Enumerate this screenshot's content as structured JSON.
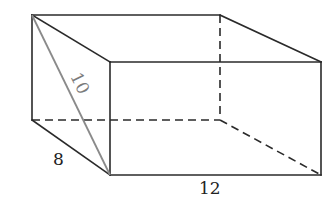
{
  "figure": {
    "type": "rectangular-prism",
    "labels": {
      "diagonal": "10",
      "depth": "8",
      "length": "12"
    },
    "colors": {
      "edge": "#2a2a2a",
      "diagonal": "#8a8a8a",
      "background": "#ffffff"
    }
  }
}
